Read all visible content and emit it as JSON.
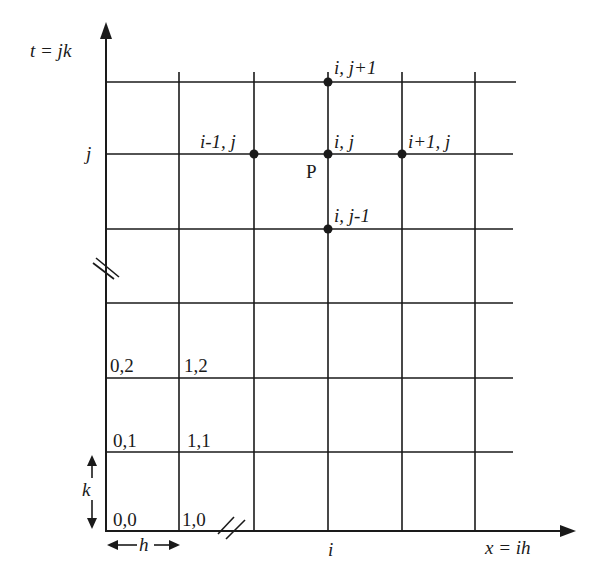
{
  "diagram": {
    "axes": {
      "y_label": "t = jk",
      "x_label": "x = ih",
      "y_tick_label": "j",
      "x_tick_label": "i"
    },
    "nodes": [
      {
        "id": "top",
        "label": "i, j+1"
      },
      {
        "id": "left",
        "label": "i-1, j"
      },
      {
        "id": "center",
        "label": "i, j"
      },
      {
        "id": "right",
        "label": "i+1, j"
      },
      {
        "id": "bottom",
        "label": "i, j-1"
      }
    ],
    "center_point_label": "P",
    "corner_labels": {
      "n00": "0,0",
      "n10": "1,0",
      "n01": "0,1",
      "n11": "1,1",
      "n02": "0,2",
      "n12": "1,2"
    },
    "spacing": {
      "h_label": "h",
      "k_label": "k"
    },
    "line_color": "#1a1a1a"
  }
}
